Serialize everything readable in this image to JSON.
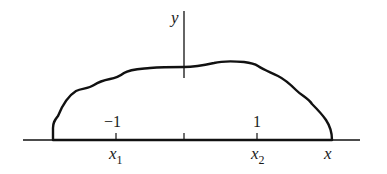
{
  "diagram": {
    "axes": {
      "x_label": "x",
      "y_label": "y"
    },
    "tick_labels": {
      "minus_one": "−1",
      "one": "1"
    },
    "points": {
      "x1": {
        "base": "x",
        "sub": "1"
      },
      "x2": {
        "base": "x",
        "sub": "2"
      }
    },
    "colors": {
      "stroke": "#111111",
      "text": "#1a1a1a",
      "background": "#ffffff"
    }
  }
}
